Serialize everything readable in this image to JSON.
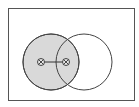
{
  "diagram": {
    "type": "venn",
    "universe": {
      "label": "",
      "x": 8,
      "y": 8,
      "width": 126,
      "height": 92,
      "stroke": "#555555"
    },
    "circles": [
      {
        "id": "A",
        "label": "",
        "cx": 51,
        "cy": 62,
        "r": 28,
        "fill": "#d9d9d9",
        "shaded": true,
        "stroke": "#444444"
      },
      {
        "id": "B",
        "label": "",
        "cx": 84,
        "cy": 62,
        "r": 28,
        "fill": "none",
        "shaded": false,
        "stroke": "#444444"
      }
    ],
    "markers": [
      {
        "id": "m1",
        "symbol": "circled-x",
        "cx": 41,
        "cy": 62,
        "r": 3.5,
        "region": "A-only"
      },
      {
        "id": "m2",
        "symbol": "circled-x",
        "cx": 66,
        "cy": 62,
        "r": 3.5,
        "region": "A-and-B"
      }
    ],
    "connector": {
      "from": "m1",
      "to": "m2",
      "meaning": "bar joining possible locations"
    },
    "colors": {
      "shade": "#d9d9d9",
      "stroke": "#444444",
      "background": "#ffffff"
    }
  }
}
